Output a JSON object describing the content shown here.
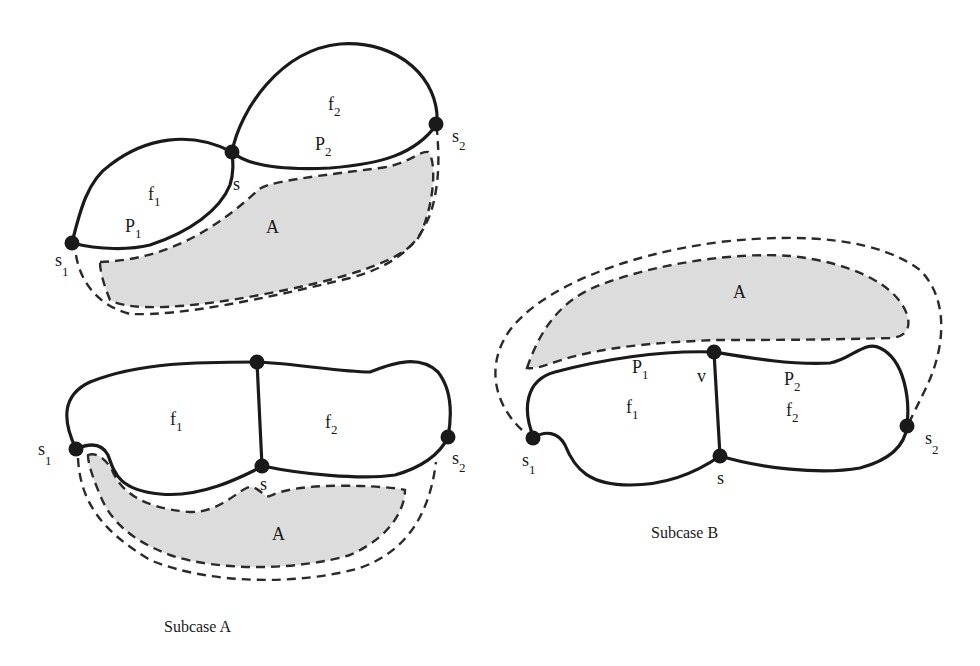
{
  "figures": {
    "top_left": {
      "faces": {
        "f1": {
          "base": "f",
          "sub": "1"
        },
        "f2": {
          "base": "f",
          "sub": "2"
        }
      },
      "paths": {
        "p1": {
          "base": "P",
          "sub": "1"
        },
        "p2": {
          "base": "P",
          "sub": "2"
        }
      },
      "vertices": {
        "s": "s",
        "s1": {
          "base": "s",
          "sub": "1"
        },
        "s2": {
          "base": "s",
          "sub": "2"
        }
      },
      "region": "A"
    },
    "subcase_a": {
      "caption": "Subcase A",
      "faces": {
        "f1": {
          "base": "f",
          "sub": "1"
        },
        "f2": {
          "base": "f",
          "sub": "2"
        }
      },
      "vertices": {
        "s": "s",
        "s1": {
          "base": "s",
          "sub": "1"
        },
        "s2": {
          "base": "s",
          "sub": "2"
        }
      },
      "region": "A"
    },
    "subcase_b": {
      "caption": "Subcase B",
      "faces": {
        "f1": {
          "base": "f",
          "sub": "1"
        },
        "f2": {
          "base": "f",
          "sub": "2"
        }
      },
      "paths": {
        "p1": {
          "base": "P",
          "sub": "1"
        },
        "p2": {
          "base": "P",
          "sub": "2"
        }
      },
      "vertices": {
        "s": "s",
        "v": "v",
        "s1": {
          "base": "s",
          "sub": "1"
        },
        "s2": {
          "base": "s",
          "sub": "2"
        }
      },
      "region": "A"
    }
  },
  "colors": {
    "stroke": "#1a1a1a",
    "region_fill": "#dcdcdc",
    "background": "#ffffff"
  }
}
